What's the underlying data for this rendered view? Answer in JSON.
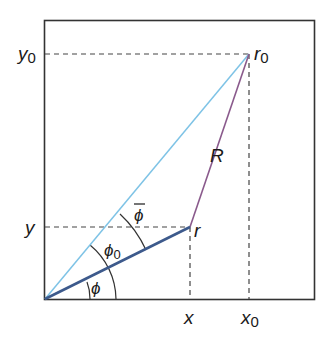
{
  "diagram": {
    "labels": {
      "y0": "y",
      "y0_sub": "0",
      "y": "y",
      "x": "x",
      "x0": "x",
      "x0_sub": "0",
      "r0": "r",
      "r0_sub": "0",
      "r": "r",
      "R": "R",
      "phi": "ϕ",
      "phi0": "ϕ",
      "phi0_sub": "0",
      "phi_bar": "ϕ"
    },
    "colors": {
      "frame": "#333333",
      "dashed": "#444444",
      "r0_line": "#7ec3e6",
      "r_line": "#3d5a8c",
      "R_line": "#8a5a8c",
      "arc": "#333333",
      "text": "#1a1a1a"
    },
    "points": {
      "origin": [
        45,
        299
      ],
      "r0": [
        249,
        54
      ],
      "r": [
        190,
        227
      ]
    }
  }
}
